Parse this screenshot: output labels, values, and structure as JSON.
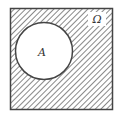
{
  "diagram": {
    "type": "venn",
    "universe_label": "Ω",
    "set_label": "A",
    "shaded_region": "complement of A",
    "colors": {
      "stroke": "#444444",
      "hatch": "#555555",
      "background": "#ffffff"
    }
  }
}
